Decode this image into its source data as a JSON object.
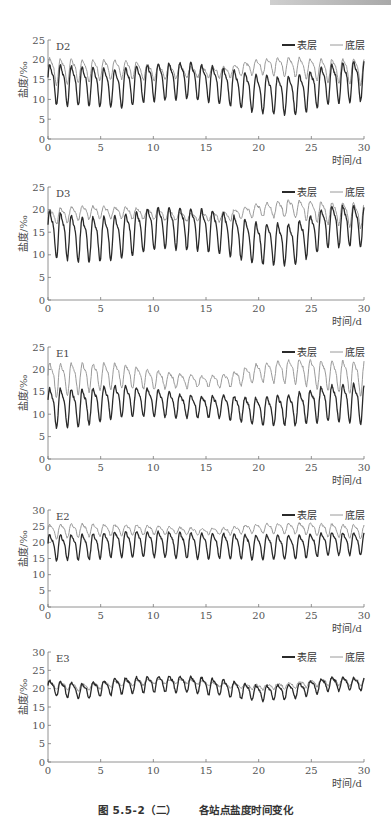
{
  "figure": {
    "caption_number": "图 5.5-2（二）",
    "caption_title": "各站点盐度时间变化"
  },
  "legend": {
    "surface": "表层",
    "bottom": "底层"
  },
  "axis": {
    "ylabel": "盐度/‰",
    "xlabel": "时间/d",
    "xticks": [
      0,
      5,
      10,
      15,
      20,
      25,
      30
    ]
  },
  "colors": {
    "surface": "#2a2a2a",
    "bottom": "#9a9a9a",
    "axis": "#777777"
  },
  "chart_data": [
    {
      "type": "line",
      "title": "D2",
      "xlabel": "时间/d",
      "ylabel": "盐度/‰",
      "xlim": [
        0,
        30
      ],
      "ylim": [
        0,
        25
      ],
      "yticks": [
        0,
        5,
        10,
        15,
        20,
        25
      ],
      "legend_position": "top-right",
      "grid": false,
      "series": [
        {
          "name": "表层",
          "amp_start": 4.5,
          "amp_mid": 4.0,
          "amp_end": 4.5,
          "base": [
            14.5,
            14.0,
            13.5,
            15.0,
            15.5,
            14.0,
            12.0,
            11.5,
            14.5,
            15.5
          ],
          "note": "tidal oscillation ~1 cycle/day, range ~8–21"
        },
        {
          "name": "底层",
          "amp_start": 3.0,
          "amp_mid": 1.0,
          "amp_end": 3.0,
          "base": [
            17.5,
            17.5,
            18.0,
            17.0,
            17.0,
            17.0,
            18.5,
            18.5,
            17.5,
            17.5
          ],
          "note": "range ~14–22, damped around day 18–22"
        }
      ]
    },
    {
      "type": "line",
      "title": "D3",
      "xlabel": "时间/d",
      "ylabel": "盐度/‰",
      "xlim": [
        0,
        30
      ],
      "ylim": [
        0,
        25
      ],
      "yticks": [
        0,
        5,
        10,
        15,
        20,
        25
      ],
      "legend_position": "top-right",
      "grid": false,
      "series": [
        {
          "name": "表层",
          "amp_start": 4.5,
          "amp_mid": 4.0,
          "amp_end": 4.0,
          "base": [
            15.5,
            14.0,
            14.5,
            16.5,
            16.5,
            15.5,
            13.0,
            13.0,
            17.0,
            17.0
          ],
          "note": "range ~10–22"
        },
        {
          "name": "底层",
          "amp_start": 1.5,
          "amp_mid": 0.7,
          "amp_end": 2.5,
          "base": [
            18.5,
            19.5,
            19.5,
            19.0,
            18.5,
            18.5,
            20.0,
            20.5,
            19.5,
            19.0
          ],
          "note": "range ~17–22"
        }
      ]
    },
    {
      "type": "line",
      "title": "E1",
      "xlabel": "时间/d",
      "ylabel": "盐度/‰",
      "xlim": [
        0,
        30
      ],
      "ylim": [
        0,
        25
      ],
      "yticks": [
        0,
        5,
        10,
        15,
        20,
        25
      ],
      "legend_position": "top-right",
      "grid": false,
      "series": [
        {
          "name": "表层",
          "amp_start": 4.0,
          "amp_mid": 2.0,
          "amp_end": 4.0,
          "base": [
            12.0,
            12.0,
            13.5,
            13.0,
            12.0,
            12.0,
            11.0,
            11.5,
            13.0,
            13.0
          ],
          "note": "range ~6–18"
        },
        {
          "name": "底层",
          "amp_start": 3.5,
          "amp_mid": 1.0,
          "amp_end": 3.5,
          "base": [
            18.0,
            18.5,
            19.0,
            18.0,
            17.5,
            17.5,
            19.5,
            20.0,
            19.0,
            18.5
          ],
          "note": "range ~14–22"
        }
      ]
    },
    {
      "type": "line",
      "title": "E2",
      "xlabel": "时间/d",
      "ylabel": "盐度/‰",
      "xlim": [
        0,
        30
      ],
      "ylim": [
        0,
        30
      ],
      "yticks": [
        0,
        5,
        10,
        15,
        20,
        25,
        30
      ],
      "legend_position": "top-right",
      "grid": false,
      "series": [
        {
          "name": "表层",
          "amp_start": 3.5,
          "amp_mid": 3.5,
          "amp_end": 3.0,
          "base": [
            19.0,
            19.0,
            20.0,
            20.0,
            19.5,
            19.5,
            19.0,
            19.0,
            20.0,
            20.0
          ],
          "note": "range ~13–25"
        },
        {
          "name": "底层",
          "amp_start": 2.0,
          "amp_mid": 0.8,
          "amp_end": 2.0,
          "base": [
            23.5,
            24.0,
            24.0,
            24.0,
            23.5,
            23.5,
            24.5,
            24.5,
            24.0,
            23.5
          ],
          "note": "range ~21–27"
        }
      ]
    },
    {
      "type": "line",
      "title": "E3",
      "xlabel": "时间/d",
      "ylabel": "盐度/‰",
      "xlim": [
        0,
        30
      ],
      "ylim": [
        0,
        30
      ],
      "yticks": [
        0,
        5,
        10,
        15,
        20,
        25,
        30
      ],
      "legend_position": "top-right",
      "grid": false,
      "series": [
        {
          "name": "表层",
          "amp_start": 1.8,
          "amp_mid": 2.0,
          "amp_end": 1.5,
          "base": [
            20.5,
            19.5,
            21.0,
            21.5,
            21.5,
            20.5,
            19.0,
            19.5,
            21.5,
            21.5
          ],
          "note": "range ~15–24"
        },
        {
          "name": "底层",
          "amp_start": 1.0,
          "amp_mid": 0.4,
          "amp_end": 1.0,
          "base": [
            21.0,
            20.5,
            21.5,
            22.0,
            22.0,
            21.0,
            20.5,
            21.0,
            22.0,
            22.0
          ],
          "note": "range ~19–24"
        }
      ]
    }
  ],
  "panels": [
    {
      "top": 30,
      "height": 130,
      "plot_top": 10,
      "plot_h": 99,
      "station": "D2",
      "show_xlabel": true
    },
    {
      "top": 178,
      "height": 150,
      "plot_top": 9,
      "plot_h": 113,
      "station": "D3",
      "show_xlabel": true
    },
    {
      "top": 338,
      "height": 150,
      "plot_top": 9,
      "plot_h": 112,
      "station": "E1",
      "show_xlabel": true
    },
    {
      "top": 500,
      "height": 135,
      "plot_top": 10,
      "plot_h": 97,
      "station": "E2",
      "show_xlabel": true
    },
    {
      "top": 642,
      "height": 150,
      "plot_top": 10,
      "plot_h": 110,
      "station": "E3",
      "show_xlabel": true
    }
  ]
}
